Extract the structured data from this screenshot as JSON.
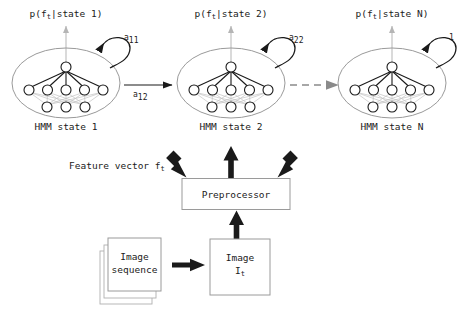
{
  "diagram": {
    "colors": {
      "stroke_dark": "#1a1a1a",
      "stroke_light": "#b5b5b5",
      "stroke_mid": "#8a8a8a",
      "box_border": "#9a9a9a",
      "background": "#ffffff",
      "text": "#1a1a1a"
    },
    "states": [
      {
        "id": "state-1",
        "emission_label": "p(f",
        "emission_sub": "t",
        "emission_tail": "|state 1)",
        "emission_full": "p(f_t|state 1)",
        "caption": "HMM state 1",
        "self_loop_label": "a",
        "self_loop_sub": "11",
        "network": {
          "top_nodes": 1,
          "middle_nodes": 5,
          "bottom_nodes": 3
        }
      },
      {
        "id": "state-2",
        "emission_label": "p(f",
        "emission_sub": "t",
        "emission_tail": "|state 2)",
        "emission_full": "p(f_t|state 2)",
        "caption": "HMM state 2",
        "self_loop_label": "a",
        "self_loop_sub": "22",
        "network": {
          "top_nodes": 1,
          "middle_nodes": 5,
          "bottom_nodes": 3
        }
      },
      {
        "id": "state-n",
        "emission_label": "p(f",
        "emission_sub": "t",
        "emission_tail": "|state N)",
        "emission_full": "p(f_t|state N)",
        "caption": "HMM state N",
        "self_loop_label": "1",
        "self_loop_sub": "",
        "network": {
          "top_nodes": 1,
          "middle_nodes": 5,
          "bottom_nodes": 3
        }
      }
    ],
    "transitions": [
      {
        "id": "t-12",
        "label": "a",
        "sub": "12",
        "style": "solid"
      },
      {
        "id": "t-2n",
        "label": "",
        "sub": "",
        "style": "dashed"
      }
    ],
    "feature_vector": {
      "label": "Feature vector f",
      "sub": "t",
      "full": "Feature vector f_t"
    },
    "preprocessor": {
      "label": "Preprocessor"
    },
    "image_sequence": {
      "line1": "Image",
      "line2": "sequence"
    },
    "image_frame": {
      "line1": "Image",
      "line2": "I",
      "sub": "t"
    }
  }
}
